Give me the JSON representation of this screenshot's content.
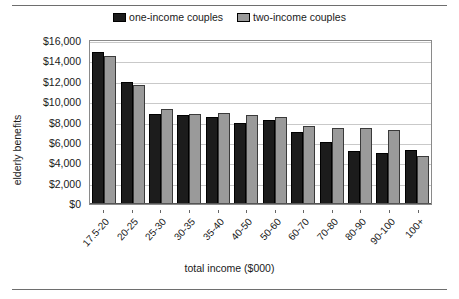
{
  "chart_data": {
    "type": "bar",
    "title": "",
    "xlabel": "total income ($000)",
    "ylabel": "elderly benefits",
    "ylim": [
      0,
      16000
    ],
    "ytick_labels": [
      "$16,000",
      "$14,000",
      "$12,000",
      "$10,000",
      "$8,000",
      "$6,000",
      "$4,000",
      "$2,000",
      "$0"
    ],
    "ytick_values": [
      16000,
      14000,
      12000,
      10000,
      8000,
      6000,
      4000,
      2000,
      0
    ],
    "grid": true,
    "legend_position": "top-center",
    "categories": [
      "17.5-20",
      "20-25",
      "25-30",
      "30-35",
      "35-40",
      "40-50",
      "50-60",
      "60-70",
      "70-80",
      "80-90",
      "90-100",
      "100+"
    ],
    "series": [
      {
        "name": "one-income couples",
        "color": "#1c1c1c",
        "values": [
          14900,
          12000,
          8800,
          8700,
          8500,
          8000,
          8250,
          7100,
          6050,
          5250,
          5050,
          5350
        ]
      },
      {
        "name": "two-income couples",
        "color": "#9a9a9a",
        "values": [
          14550,
          11650,
          9350,
          8850,
          8950,
          8750,
          8500,
          7700,
          7450,
          7450,
          7300,
          4750
        ]
      }
    ]
  },
  "legend": {
    "items": [
      {
        "label": "one-income couples",
        "swatch": "#1c1c1c"
      },
      {
        "label": "two-income couples",
        "swatch": "#9a9a9a"
      }
    ]
  },
  "axes": {
    "y_title": "elderly benefits",
    "x_title": "total income ($000)"
  }
}
